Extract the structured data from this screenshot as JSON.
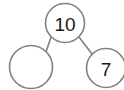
{
  "diagram": {
    "type": "number-bond-tree",
    "background_color": "#ffffff",
    "stroke_color": "#808080",
    "text_color": "#1a1a1a",
    "nodes": [
      {
        "id": "root",
        "role": "whole",
        "label": "10",
        "empty": false,
        "cx": 65,
        "cy": 23,
        "r": 19.5
      },
      {
        "id": "left-child",
        "role": "part",
        "label": "",
        "empty": true,
        "cx": 31,
        "cy": 67,
        "r": 21.5
      },
      {
        "id": "right-child",
        "role": "part",
        "label": "7",
        "empty": false,
        "cx": 106,
        "cy": 68,
        "r": 19.5
      }
    ],
    "edges": [
      {
        "id": "edge-root-left",
        "from": "root",
        "to": "left-child",
        "x1": 51,
        "y1": 37,
        "x2": 46,
        "y2": 52
      },
      {
        "id": "edge-root-right",
        "from": "root",
        "to": "right-child",
        "x1": 79,
        "y1": 37,
        "x2": 92,
        "y2": 54
      }
    ]
  }
}
